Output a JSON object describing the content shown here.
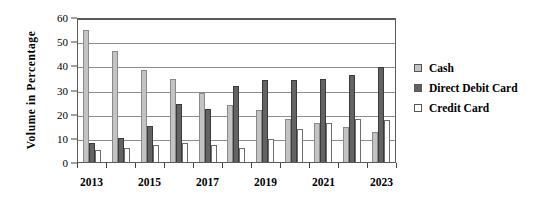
{
  "chart_data": {
    "type": "bar",
    "title": "",
    "xlabel": "",
    "ylabel": "Volume in Percentage",
    "ylim": [
      0,
      60
    ],
    "yticks": [
      0,
      10,
      20,
      30,
      40,
      50,
      60
    ],
    "grid": true,
    "legend_position": "right",
    "categories": [
      "2013",
      "2014",
      "2015",
      "2016",
      "2017",
      "2018",
      "2019",
      "2020",
      "2021",
      "2022",
      "2023"
    ],
    "tick_labels": [
      "2013",
      "",
      "2015",
      "",
      "2017",
      "",
      "2019",
      "",
      "2021",
      "",
      "2023"
    ],
    "series": [
      {
        "name": "Cash",
        "color": "#c3c3c3",
        "values": [
          54.5,
          46,
          38,
          34.5,
          28.5,
          23.5,
          21.5,
          18,
          16,
          14.5,
          12.5
        ]
      },
      {
        "name": "Direct Debit Card",
        "color": "#636363",
        "values": [
          8,
          10,
          15,
          24,
          22,
          31.5,
          34,
          34,
          34.5,
          36,
          39.5
        ]
      },
      {
        "name": "Credit Card",
        "color": "#ffffff",
        "values": [
          5,
          6,
          7,
          8,
          7,
          6,
          9.5,
          13.5,
          16,
          18,
          17.5
        ]
      }
    ]
  },
  "legend": {
    "items": [
      {
        "label": "Cash"
      },
      {
        "label": "Direct  Debit  Card"
      },
      {
        "label": "Credit  Card"
      }
    ]
  }
}
